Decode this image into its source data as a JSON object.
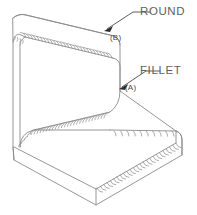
{
  "drawing": {
    "title": "",
    "object_type": "L-shaped block (angle bracket), isometric view",
    "line_color": "#8a8a8a",
    "fill_color": "#ffffff",
    "text_color": "#5f5f5f",
    "background": "#ffffff"
  },
  "annotations": [
    {
      "id": "round",
      "label": "ROUND",
      "reference": "(B)",
      "feature": "convex rounded edge at top of vertical wall",
      "leader_from": [
        133,
        12
      ],
      "leader_to": [
        105,
        30
      ]
    },
    {
      "id": "fillet",
      "label": "FILLET",
      "reference": "(A)",
      "feature": "concave filleted edge at inside corner",
      "leader_from": [
        146,
        71
      ],
      "leader_to": [
        120,
        88
      ]
    }
  ],
  "labels": {
    "round": "ROUND",
    "fillet": "FILLET",
    "ref_b": "(B)",
    "ref_a": "(A)"
  }
}
